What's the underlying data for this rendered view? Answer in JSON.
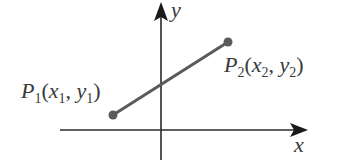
{
  "diagram": {
    "type": "coordinate-plane-line-segment",
    "axes": {
      "x_label": "x",
      "y_label": "y"
    },
    "points": [
      {
        "name": "P",
        "index": "1",
        "x_var": "x",
        "x_sub": "1",
        "y_var": "y",
        "y_sub": "1",
        "label_full": "P1(x1, y1)"
      },
      {
        "name": "P",
        "index": "2",
        "x_var": "x",
        "x_sub": "2",
        "y_var": "y",
        "y_sub": "2",
        "label_full": "P2(x2, y2)"
      }
    ],
    "punct": {
      "open": "(",
      "comma": ", ",
      "close": ")"
    },
    "colors": {
      "axis": "#2a2a2a",
      "segment": "#5a5a5a",
      "point": "#5a5a5a",
      "text": "#3a3a3a",
      "background": "#ffffff"
    }
  }
}
